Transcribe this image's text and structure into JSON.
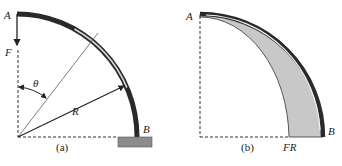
{
  "figure": {
    "panel_a": {
      "caption": "(a)",
      "labels": {
        "point_a": "A",
        "point_b": "B",
        "force": "F",
        "angle": "θ",
        "radius": "R"
      }
    },
    "panel_b": {
      "caption": "(b)",
      "labels": {
        "point_a": "A",
        "point_b": "B",
        "moment": "FR"
      }
    },
    "colors": {
      "beam_dark": "#2a2a2a",
      "beam_light": "#e0e0e0",
      "shaded": "#c8c8c8",
      "support": "#8c8c8c",
      "line": "#333333"
    }
  }
}
